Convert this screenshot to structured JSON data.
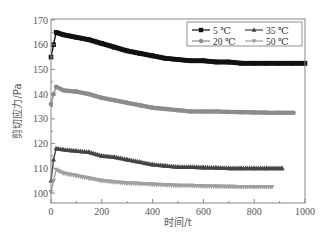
{
  "chart_data": {
    "type": "line",
    "title": "",
    "xlabel": "时间/t",
    "ylabel": "剪切应力/Pa",
    "xlim": [
      0,
      1000
    ],
    "ylim": [
      97,
      170
    ],
    "xticks": [
      0,
      200,
      400,
      600,
      800,
      1000
    ],
    "yticks": [
      100,
      110,
      120,
      130,
      140,
      150,
      160,
      170
    ],
    "grid": false,
    "legend_position": "upper right",
    "series": [
      {
        "name": "5 ℃",
        "marker": "square",
        "color": "#111111",
        "x": [
          0,
          10,
          20,
          50,
          100,
          150,
          200,
          250,
          300,
          350,
          400,
          450,
          500,
          550,
          600,
          650,
          700,
          750,
          800,
          850,
          900,
          950,
          1000
        ],
        "values": [
          155,
          160,
          165,
          164,
          163,
          162,
          160.5,
          159,
          157.5,
          156.5,
          155.5,
          154.5,
          154,
          153.5,
          153.5,
          153,
          153,
          152.5,
          152.5,
          152.5,
          152.5,
          152.5,
          152.5
        ]
      },
      {
        "name": "20 ℃",
        "marker": "circle",
        "color": "#8c8c8c",
        "x": [
          0,
          10,
          20,
          50,
          100,
          150,
          200,
          250,
          300,
          350,
          400,
          450,
          500,
          550,
          600,
          650,
          700,
          750,
          800,
          850,
          900,
          955
        ],
        "values": [
          136,
          140,
          143,
          141.5,
          141,
          140,
          138.5,
          137.5,
          136.5,
          135.5,
          134.5,
          134,
          133.5,
          133,
          133,
          133,
          132.8,
          132.7,
          132.6,
          132.5,
          132.5,
          132.5
        ]
      },
      {
        "name": "35 ℃",
        "marker": "triangle-up",
        "color": "#444444",
        "x": [
          0,
          10,
          20,
          50,
          100,
          150,
          200,
          250,
          300,
          350,
          400,
          450,
          500,
          550,
          600,
          650,
          700,
          750,
          800,
          850,
          910
        ],
        "values": [
          105,
          113.5,
          118,
          117.5,
          117,
          116.5,
          115,
          114.5,
          113.5,
          112.5,
          111.5,
          111,
          110.5,
          110.5,
          110.3,
          110.2,
          110,
          110,
          110,
          110,
          110
        ]
      },
      {
        "name": "50 ℃",
        "marker": "triangle-down",
        "color": "#a0a0a0",
        "x": [
          0,
          10,
          20,
          50,
          100,
          150,
          200,
          250,
          300,
          350,
          400,
          450,
          500,
          550,
          600,
          650,
          700,
          750,
          800,
          870
        ],
        "values": [
          100.5,
          105,
          109.5,
          108,
          107,
          106,
          105,
          104.5,
          104,
          103.8,
          103.5,
          103.3,
          103,
          103,
          102.8,
          102.7,
          102.6,
          102.5,
          102.5,
          102.5
        ]
      }
    ]
  }
}
